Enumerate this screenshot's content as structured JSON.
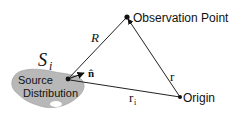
{
  "diagram": {
    "labels": {
      "observation_point": "Observation Point",
      "origin": "Origin",
      "source_line1": "Source",
      "source_line2": "Distribution",
      "surface": "S",
      "surface_sub": "i",
      "vector_R": "R",
      "vector_r": "r",
      "vector_ri": "r",
      "vector_ri_sub": "i",
      "normal": "n̂"
    },
    "colors": {
      "blob_fill": "#b8b8b8",
      "line": "#222222",
      "text": "#111111"
    }
  }
}
